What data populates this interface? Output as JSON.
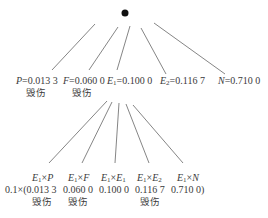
{
  "root": {
    "symbol": "●"
  },
  "level1": [
    {
      "sym": "P",
      "sub": "",
      "value": "=0.013 3",
      "tag": "毁伤"
    },
    {
      "sym": "F",
      "sub": "",
      "value": "=0.060 0",
      "tag": "毁伤"
    },
    {
      "sym": "E",
      "sub": "1",
      "value": "=0.100 0",
      "tag": ""
    },
    {
      "sym": "E",
      "sub": "2",
      "value": "=0.116 7",
      "tag": ""
    },
    {
      "sym": "N",
      "sub": "",
      "value": "=0.710 0",
      "tag": ""
    }
  ],
  "level2": [
    {
      "expr_a": "E",
      "expr_a_sub": "1",
      "op": "×",
      "expr_b": "P",
      "expr_b_sub": "",
      "value": "0.1×(0.013 3",
      "tag": "毁伤"
    },
    {
      "expr_a": "E",
      "expr_a_sub": "1",
      "op": "×",
      "expr_b": "F",
      "expr_b_sub": "",
      "value": "0.060 0",
      "tag": "毁伤"
    },
    {
      "expr_a": "E",
      "expr_a_sub": "1",
      "op": "×",
      "expr_b": "E",
      "expr_b_sub": "1",
      "value": "0.100 0",
      "tag": ""
    },
    {
      "expr_a": "E",
      "expr_a_sub": "1",
      "op": "×",
      "expr_b": "E",
      "expr_b_sub": "2",
      "value": "0.116 7",
      "tag": "毁伤"
    },
    {
      "expr_a": "E",
      "expr_a_sub": "1",
      "op": "×",
      "expr_b": "N",
      "expr_b_sub": "",
      "value": "0.710 0)",
      "tag": ""
    }
  ],
  "colors": {
    "line": "#555555",
    "text": "#3a3a3a",
    "node": "#111111"
  }
}
